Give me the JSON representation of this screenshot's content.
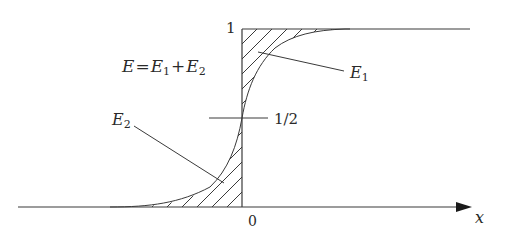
{
  "diagram": {
    "equation_label": {
      "E": "E",
      "eq": "=",
      "E1": "E",
      "sub1": "1",
      "plus": "+",
      "E2": "E",
      "sub2": "2"
    },
    "labels": {
      "y_top": "1",
      "y_half": "1/2",
      "x_origin": "0",
      "x_axis": "x",
      "E1": "E",
      "E1_sub": "1",
      "E2": "E",
      "E2_sub": "2"
    },
    "curve": "smooth sigmoid step rising from 0 to 1 through 1/2 at x=0",
    "regions": [
      {
        "name": "E1",
        "description": "hatched area between step (value 1) and curve for x>0"
      },
      {
        "name": "E2",
        "description": "hatched area under curve for x<0"
      }
    ],
    "colors": {
      "line": "#3a3a3a",
      "background": "#ffffff"
    }
  }
}
